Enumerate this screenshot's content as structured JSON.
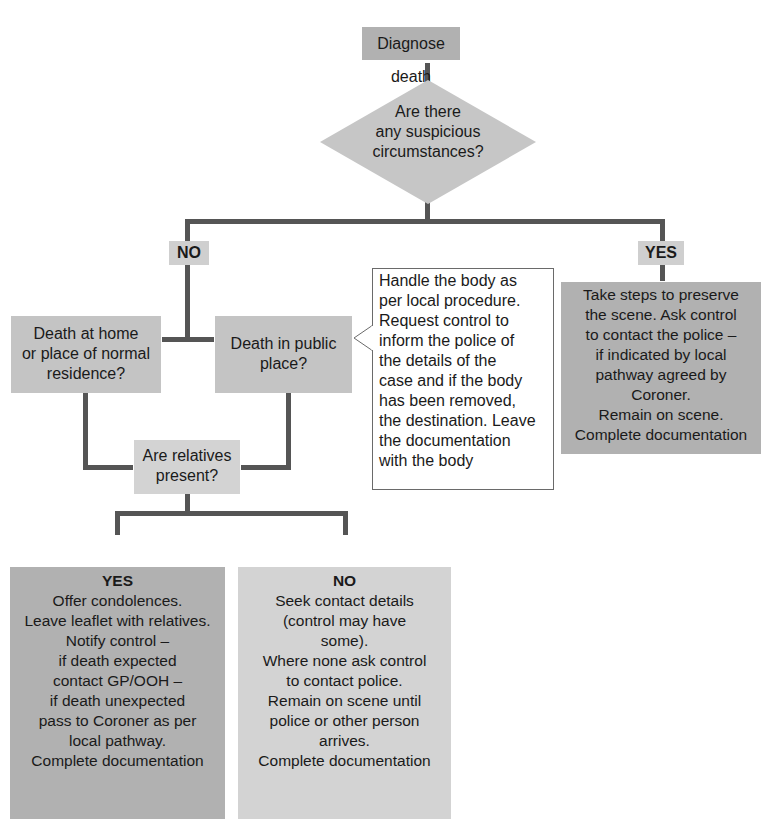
{
  "colors": {
    "connector": "#555555",
    "box_dark": "#b1b1b1",
    "box_mid": "#c4c4c4",
    "box_light": "#d3d3d3",
    "label_bg": "#cfcfcf",
    "note_border": "#6a6a6a"
  },
  "flowchart": {
    "start": {
      "text": "Diagnose death"
    },
    "decision_suspicious": {
      "lines": [
        "Are there",
        "any suspicious",
        "circumstances?"
      ]
    },
    "branch_no": {
      "label": "NO"
    },
    "branch_yes": {
      "label": "YES"
    },
    "yes_action": {
      "lines": [
        "Take steps to preserve",
        "the scene. Ask control",
        "to contact the police –",
        "if indicated by local",
        "pathway agreed by",
        "Coroner.",
        "Remain on scene.",
        "Complete documentation"
      ]
    },
    "death_at_home": {
      "lines": [
        "Death at home",
        "or place of normal",
        "residence?"
      ]
    },
    "death_public": {
      "lines": [
        "Death in public",
        "place?"
      ]
    },
    "public_note": {
      "lines": [
        "Handle the body as",
        "per local procedure.",
        "Request control to",
        "inform the police of",
        "the details of the",
        "case and if the body",
        "has been removed,",
        "the destination. Leave",
        "the documentation",
        "with the body"
      ]
    },
    "relatives_present": {
      "lines": [
        "Are relatives",
        "present?"
      ]
    },
    "relatives_yes": {
      "heading": "YES",
      "lines": [
        "Offer condolences.",
        "Leave leaflet with relatives.",
        "Notify control –",
        "if death expected",
        "contact GP/OOH –",
        "if death unexpected",
        "pass to Coroner as per",
        "local pathway.",
        "Complete documentation"
      ]
    },
    "relatives_no": {
      "heading": "NO",
      "lines": [
        "Seek contact details",
        "(control may have",
        "some).",
        "Where none ask control",
        "to contact police.",
        "Remain on scene until",
        "police or other person",
        "arrives.",
        "Complete documentation"
      ]
    }
  }
}
